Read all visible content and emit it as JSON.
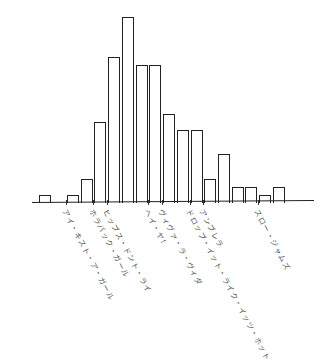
{
  "chart_data": {
    "type": "bar",
    "style": "hand-drawn (xkcd-like), no axes labels, no gridlines",
    "title": "",
    "xlabel": "",
    "ylabel": "",
    "grid": false,
    "legend": null,
    "values": [
      1,
      1,
      3,
      10,
      18,
      23,
      17,
      17,
      11,
      9,
      9,
      3,
      6,
      2,
      2,
      1,
      2
    ],
    "tick_labels": [
      {
        "label": "アイ・キスト・ア・ガール",
        "bar_index": 1
      },
      {
        "label": "ホラバック・ガール",
        "bar_index": 3
      },
      {
        "label": "ヒップス・ドント・ライ",
        "bar_index": 4
      },
      {
        "label": "ヘイ・ヤ！",
        "bar_index": 7
      },
      {
        "label": "ヴィヴァ・ラ・ヴィダ",
        "bar_index": 8
      },
      {
        "label": "ドロップ・イット・ライク・イッツ・ホット",
        "bar_index": 10
      },
      {
        "label": "アンブレラ",
        "bar_index": 11
      },
      {
        "label": "スロー・ジャムズ",
        "bar_index": 15
      }
    ],
    "ylim": [
      0,
      24
    ]
  },
  "colors": {
    "stroke": "#222222",
    "fill": "#ffffff",
    "label": "#555555"
  }
}
